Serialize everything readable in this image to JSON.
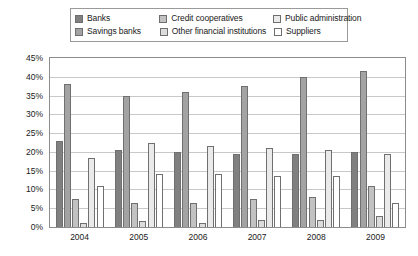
{
  "chart_data": {
    "type": "bar",
    "title": "",
    "xlabel": "",
    "ylabel": "",
    "categories": [
      "2004",
      "2005",
      "2006",
      "2007",
      "2008",
      "2009"
    ],
    "ylim": [
      0,
      45
    ],
    "ytick_step": 5,
    "ytick_labels": [
      "45%",
      "40%",
      "35%",
      "30%",
      "25%",
      "20%",
      "15%",
      "10%",
      "5%",
      "0%"
    ],
    "ytick_values": [
      45,
      40,
      35,
      30,
      25,
      20,
      15,
      10,
      5,
      0
    ],
    "grid": true,
    "legend_position": "top",
    "value_suffix": "%",
    "series": [
      {
        "name": "Banks",
        "color": "#808080",
        "values": [
          23.0,
          20.5,
          20.0,
          19.5,
          19.5,
          20.0
        ]
      },
      {
        "name": "Savings banks",
        "color": "#a3a3a3",
        "values": [
          38.0,
          35.0,
          36.0,
          37.5,
          40.0,
          41.5
        ]
      },
      {
        "name": "Credit cooperatives",
        "color": "#c2c2c2",
        "values": [
          7.5,
          6.5,
          6.5,
          7.5,
          8.0,
          11.0
        ]
      },
      {
        "name": "Other financial institutions",
        "color": "#dcdcdc",
        "values": [
          1.0,
          1.5,
          1.0,
          2.0,
          2.0,
          3.0
        ]
      },
      {
        "name": "Public administration",
        "color": "#eaeaea",
        "values": [
          18.5,
          22.5,
          21.5,
          21.0,
          20.5,
          19.5
        ]
      },
      {
        "name": "Suppliers",
        "color": "#ffffff",
        "values": [
          11.0,
          14.0,
          14.0,
          13.5,
          13.5,
          6.5
        ]
      }
    ]
  },
  "legend": {
    "rows": [
      [
        {
          "label": "Banks",
          "color": "#808080"
        },
        {
          "label": "Credit cooperatives",
          "color": "#c2c2c2"
        },
        {
          "label": "Public administration",
          "color": "#eaeaea"
        }
      ],
      [
        {
          "label": "Savings banks",
          "color": "#a3a3a3"
        },
        {
          "label": "Other financial institutions",
          "color": "#dcdcdc"
        },
        {
          "label": "Suppliers",
          "color": "#ffffff"
        }
      ]
    ]
  }
}
